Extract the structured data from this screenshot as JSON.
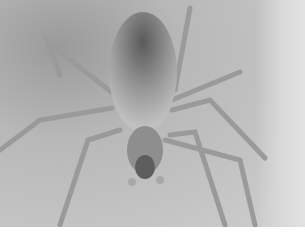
{
  "image": {
    "subject": "spider",
    "description": "Grayscale close-up photograph of a long-legged spider viewed from above, on a light gray surface",
    "colors": {
      "background": "#c4c4c4",
      "body": "#8a8a8a",
      "abdomen_dark": "#5a5a5a",
      "legs": "#9c9c9c",
      "bottom_strip": "#ffffff"
    }
  }
}
